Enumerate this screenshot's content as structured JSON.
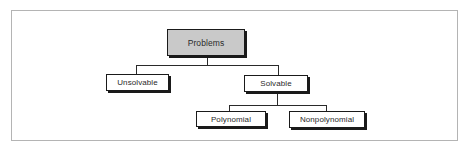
{
  "diagram": {
    "type": "tree",
    "colors": {
      "root_fill": "#c9c9c9",
      "node_fill": "#ffffff",
      "border": "#1a1a1a",
      "frame": "#b4b4b4"
    },
    "root": {
      "label": "Problems",
      "children": [
        {
          "label": "Unsolvable",
          "children": []
        },
        {
          "label": "Solvable",
          "children": [
            {
              "label": "Polynomial",
              "children": []
            },
            {
              "label": "Nonpolynomial",
              "children": []
            }
          ]
        }
      ]
    }
  },
  "nodes": {
    "problems": "Problems",
    "unsolvable": "Unsolvable",
    "solvable": "Solvable",
    "polynomial": "Polynomial",
    "nonpolynomial": "Nonpolynomial"
  }
}
